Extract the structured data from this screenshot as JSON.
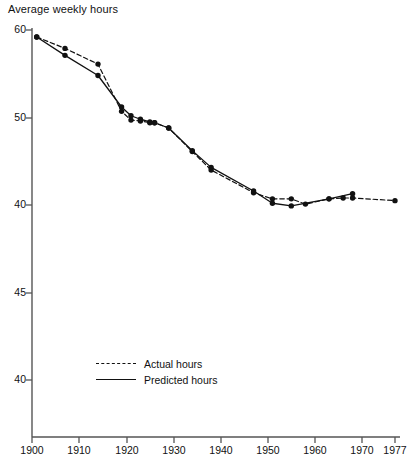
{
  "chart_data": {
    "type": "line",
    "title": "Average weekly hours",
    "xlabel": "",
    "ylabel": "Average weekly hours",
    "grid": false,
    "legend_position": "inside-lower-left",
    "xlim": [
      1898,
      1979
    ],
    "x_ticks": [
      1900,
      1910,
      1920,
      1930,
      1940,
      1950,
      1960,
      1970,
      1977
    ],
    "x_tick_labels": [
      "1900",
      "1910",
      "1920",
      "1930",
      "1940",
      "1950",
      "1960",
      "1970",
      "1977"
    ],
    "y_tick_labels": [
      "60",
      "50",
      "40",
      "45",
      "40"
    ],
    "y_tick_pixel_rows": [
      30,
      118,
      205,
      293,
      380
    ],
    "series": [
      {
        "name": "Actual hours",
        "style": "dashed",
        "marker": "filled-circle",
        "points": [
          {
            "x": 1901,
            "y": 59.2
          },
          {
            "x": 1907,
            "y": 57.9
          },
          {
            "x": 1914,
            "y": 56.1
          },
          {
            "x": 1919,
            "y": 50.7
          },
          {
            "x": 1921,
            "y": 49.7
          },
          {
            "x": 1923,
            "y": 49.6
          },
          {
            "x": 1925,
            "y": 49.4
          },
          {
            "x": 1926,
            "y": 49.4
          },
          {
            "x": 1929,
            "y": 48.8
          },
          {
            "x": 1934,
            "y": 46.1
          },
          {
            "x": 1938,
            "y": 44.0
          },
          {
            "x": 1947,
            "y": 41.4
          },
          {
            "x": 1951,
            "y": 40.7
          },
          {
            "x": 1955,
            "y": 40.7
          },
          {
            "x": 1958,
            "y": 40.1
          },
          {
            "x": 1963,
            "y": 40.7
          },
          {
            "x": 1966,
            "y": 40.8
          },
          {
            "x": 1968,
            "y": 40.8
          },
          {
            "x": 1977,
            "y": 40.5
          }
        ]
      },
      {
        "name": "Predicted hours",
        "style": "solid",
        "marker": "filled-circle",
        "points": [
          {
            "x": 1901,
            "y": 59.2
          },
          {
            "x": 1907,
            "y": 57.1
          },
          {
            "x": 1914,
            "y": 54.8
          },
          {
            "x": 1919,
            "y": 51.2
          },
          {
            "x": 1921,
            "y": 50.2
          },
          {
            "x": 1923,
            "y": 49.8
          },
          {
            "x": 1925,
            "y": 49.5
          },
          {
            "x": 1926,
            "y": 49.4
          },
          {
            "x": 1929,
            "y": 48.8
          },
          {
            "x": 1934,
            "y": 46.2
          },
          {
            "x": 1938,
            "y": 44.3
          },
          {
            "x": 1947,
            "y": 41.6
          },
          {
            "x": 1951,
            "y": 40.2
          },
          {
            "x": 1955,
            "y": 39.9
          },
          {
            "x": 1963,
            "y": 40.7
          },
          {
            "x": 1968,
            "y": 41.3
          }
        ]
      }
    ]
  },
  "axes": {
    "y_ticks": [
      {
        "label": "60",
        "row": 30
      },
      {
        "label": "50",
        "row": 118
      },
      {
        "label": "40",
        "row": 205
      },
      {
        "label": "45",
        "row": 293
      },
      {
        "label": "40",
        "row": 380
      }
    ],
    "x_ticks": [
      {
        "label": "1900",
        "col": 32
      },
      {
        "label": "1910",
        "col": 79
      },
      {
        "label": "1920",
        "col": 127
      },
      {
        "label": "1930",
        "col": 174
      },
      {
        "label": "1940",
        "col": 221
      },
      {
        "label": "1950",
        "col": 268
      },
      {
        "label": "1960",
        "col": 315
      },
      {
        "label": "1970",
        "col": 362
      },
      {
        "label": "1977",
        "col": 395
      }
    ]
  },
  "legend": {
    "items": [
      {
        "label": "Actual hours",
        "style": "dashed"
      },
      {
        "label": "Predicted hours",
        "style": "solid"
      }
    ]
  },
  "colors": {
    "ink": "#111111",
    "axis": "#555555",
    "background": "#ffffff"
  }
}
